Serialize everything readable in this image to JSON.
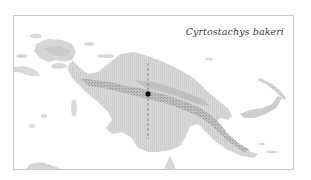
{
  "map": {
    "title": "Cyrtostachys bakeri",
    "region": "New Guinea",
    "colors": {
      "background": "#ffffff",
      "frame": "#c8c8c8",
      "land": "#dcdcdc",
      "highlight_region": "#d2d2d2",
      "mountains": "#a8a8a8",
      "transect_line": "#8a8a8a",
      "marker": "#000000",
      "title_text": "#3a3a3a"
    },
    "markers": [
      {
        "type": "occurrence-point",
        "x": 134,
        "y": 78
      }
    ],
    "transect": {
      "style": "dashed",
      "x": 134,
      "y_start": 47,
      "y_end": 123
    }
  }
}
